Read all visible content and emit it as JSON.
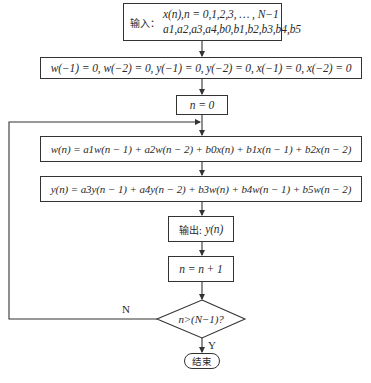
{
  "flowchart": {
    "input": {
      "label": "输入：",
      "line1": "x(n),n = 0,1,2,3, … , N−1",
      "line2": "a1,a2,a3,a4,b0,b1,b2,b3,b4,b5"
    },
    "init": "w(−1) = 0, w(−2) = 0, y(−1) = 0, y(−2) = 0, x(−1) = 0, x(−2) = 0",
    "n_init": "n = 0",
    "w_eq": "w(n) = a1w(n − 1) + a2w(n − 2) + b0x(n) + b1x(n − 1) + b2x(n − 2)",
    "y_eq": "y(n) = a3y(n − 1) + a4y(n − 2) + b3w(n) + b4w(n − 1) + b5w(n − 2)",
    "output": {
      "label": "输出:",
      "value": "y(n)"
    },
    "increment": "n = n + 1",
    "decision": "n>(N−1)?",
    "no_label": "N",
    "yes_label": "Y",
    "end": "结束"
  }
}
